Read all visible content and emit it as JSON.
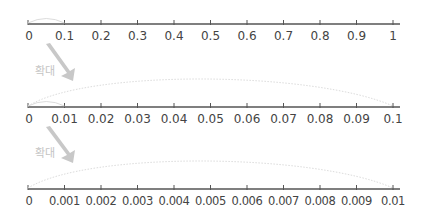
{
  "diagram": {
    "title": "",
    "zoom_label": "확대",
    "colors": {
      "axis": "#555555",
      "label": "#444444",
      "arrow": "#c8c8c8",
      "arc": "#dcdcdc",
      "zoom_label": "#c4c4c4"
    },
    "number_lines": [
      {
        "name": "number-line-0-to-1",
        "min": 0,
        "max": 1,
        "step": 0.1,
        "tick_labels": [
          "0",
          "0.1",
          "0.2",
          "0.3",
          "0.4",
          "0.5",
          "0.6",
          "0.7",
          "0.8",
          "0.9",
          "1"
        ]
      },
      {
        "name": "number-line-0-to-0.1",
        "min": 0,
        "max": 0.1,
        "step": 0.01,
        "tick_labels": [
          "0",
          "0.01",
          "0.02",
          "0.03",
          "0.04",
          "0.05",
          "0.06",
          "0.07",
          "0.08",
          "0.09",
          "0.1"
        ]
      },
      {
        "name": "number-line-0-to-0.01",
        "min": 0,
        "max": 0.01,
        "step": 0.001,
        "tick_labels": [
          "0",
          "0.001",
          "0.002",
          "0.003",
          "0.004",
          "0.005",
          "0.006",
          "0.007",
          "0.008",
          "0.009",
          "0.01"
        ]
      }
    ],
    "zoom_steps": [
      {
        "from_segment": "0 to 0.1",
        "to_line": "0 to 0.1",
        "label": "확대"
      },
      {
        "from_segment": "0 to 0.01",
        "to_line": "0 to 0.01",
        "label": "확대"
      }
    ]
  }
}
